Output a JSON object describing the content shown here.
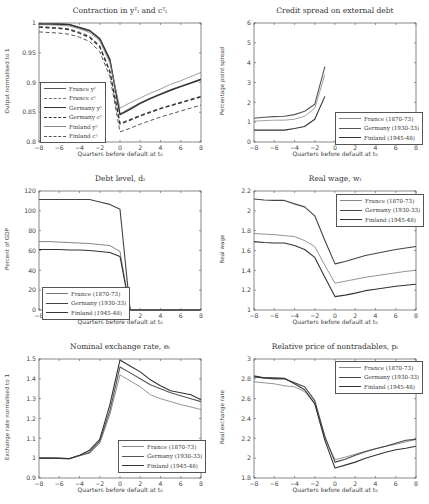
{
  "chart_data": [
    {
      "type": "line",
      "id": "contraction",
      "title": "Contraction in y_t^T and c_t^T",
      "xlabel": "Quarters before default at t_0",
      "ylabel": "Output normalised to 1",
      "xlim": [
        -8,
        8
      ],
      "ylim": [
        0.8,
        1.0
      ],
      "xticks": [
        -8,
        -6,
        -4,
        -2,
        0,
        2,
        4,
        6,
        8
      ],
      "yticks": [
        0.8,
        0.85,
        0.9,
        0.95,
        1
      ],
      "ytick_labels": [
        "0.8",
        "0.85",
        "0.9",
        "0.95",
        "1"
      ],
      "legend_position": "lower left",
      "legend_box": {
        "left": 40,
        "top": 82
      },
      "x": [
        -8,
        -7,
        -6,
        -5,
        -4,
        -3,
        -2,
        -1,
        0,
        1,
        2,
        3,
        4,
        5,
        6,
        7,
        8
      ],
      "series": [
        {
          "name": "France y^T",
          "style": "solid",
          "width": 0.8,
          "color": "#555555",
          "values": [
            0.999,
            0.999,
            0.999,
            0.998,
            0.993,
            0.988,
            0.975,
            0.94,
            0.847,
            0.857,
            0.866,
            0.874,
            0.881,
            0.888,
            0.894,
            0.9,
            0.906
          ]
        },
        {
          "name": "France c^T",
          "style": "dashed",
          "width": 0.8,
          "color": "#777777",
          "values": [
            0.994,
            0.993,
            0.992,
            0.99,
            0.985,
            0.978,
            0.962,
            0.92,
            0.832,
            0.838,
            0.845,
            0.851,
            0.857,
            0.862,
            0.867,
            0.872,
            0.877
          ]
        },
        {
          "name": "Germany y^T",
          "style": "solid",
          "width": 1.4,
          "color": "#333333",
          "values": [
            0.998,
            0.998,
            0.998,
            0.997,
            0.992,
            0.987,
            0.973,
            0.938,
            0.846,
            0.855,
            0.865,
            0.873,
            0.88,
            0.887,
            0.893,
            0.899,
            0.905
          ]
        },
        {
          "name": "Germany c^T",
          "style": "dashed",
          "width": 1.4,
          "color": "#333333",
          "values": [
            0.993,
            0.992,
            0.991,
            0.989,
            0.983,
            0.976,
            0.96,
            0.918,
            0.83,
            0.837,
            0.844,
            0.85,
            0.856,
            0.861,
            0.866,
            0.871,
            0.876
          ]
        },
        {
          "name": "Finland y^T",
          "style": "solid",
          "width": 0.8,
          "color": "#888888",
          "values": [
            0.997,
            0.997,
            0.996,
            0.995,
            0.99,
            0.984,
            0.97,
            0.933,
            0.857,
            0.866,
            0.874,
            0.882,
            0.889,
            0.897,
            0.903,
            0.91,
            0.917
          ]
        },
        {
          "name": "Finland c^T",
          "style": "dashed",
          "width": 1.0,
          "color": "#555555",
          "values": [
            0.985,
            0.984,
            0.983,
            0.981,
            0.976,
            0.969,
            0.952,
            0.91,
            0.817,
            0.823,
            0.83,
            0.836,
            0.842,
            0.847,
            0.852,
            0.857,
            0.862
          ]
        }
      ]
    },
    {
      "type": "line",
      "id": "credit-spread",
      "title": "Credit spread on external debt",
      "xlabel": "Quarters before default at t_0",
      "ylabel": "Percentage point spread",
      "xlim": [
        -8,
        8
      ],
      "ylim": [
        0,
        6
      ],
      "xticks": [
        -8,
        -6,
        -4,
        -2,
        0,
        2,
        4,
        6,
        8
      ],
      "yticks": [
        0,
        1,
        2,
        3,
        4,
        5,
        6
      ],
      "ytick_labels": [
        "0",
        "1",
        "2",
        "3",
        "4",
        "5",
        "6"
      ],
      "legend_position": "lower right",
      "legend_box": {
        "left": 335,
        "top": 112
      },
      "x": [
        -8,
        -7,
        -6,
        -5,
        -4,
        -3,
        -2,
        -1
      ],
      "series": [
        {
          "name": "France (1870-73)",
          "style": "solid",
          "width": 0.8,
          "color": "#888888",
          "values": [
            1.05,
            1.08,
            1.1,
            1.1,
            1.15,
            1.3,
            1.7,
            3.4
          ]
        },
        {
          "name": "Germany (1930-33)",
          "style": "solid",
          "width": 1.1,
          "color": "#555555",
          "values": [
            1.2,
            1.25,
            1.28,
            1.3,
            1.38,
            1.55,
            1.9,
            3.8
          ]
        },
        {
          "name": "Finland (1945-48)",
          "style": "solid",
          "width": 1.1,
          "color": "#333333",
          "values": [
            0.6,
            0.6,
            0.6,
            0.6,
            0.68,
            0.78,
            1.15,
            2.3
          ]
        }
      ]
    },
    {
      "type": "line",
      "id": "debt-level",
      "title": "Debt level, d_t",
      "xlabel": "Quarters before default at t_0",
      "ylabel": "Percent of GDP",
      "xlim": [
        -8,
        8
      ],
      "ylim": [
        0,
        120
      ],
      "xticks": [
        -8,
        -6,
        -4,
        -2,
        0,
        2,
        4,
        6,
        8
      ],
      "yticks": [
        0,
        20,
        40,
        60,
        80,
        100,
        120
      ],
      "ytick_labels": [
        "0",
        "20",
        "40",
        "60",
        "80",
        "100",
        "120"
      ],
      "legend_position": "lower left",
      "legend_box": {
        "left": 42,
        "top": 287
      },
      "x": [
        -8,
        -7,
        -6,
        -5,
        -4,
        -3,
        -2,
        -1,
        0,
        1,
        2,
        3,
        4,
        5,
        6,
        7,
        8
      ],
      "series": [
        {
          "name": "France (1870-73)",
          "style": "solid",
          "width": 0.9,
          "color": "#777777",
          "values": [
            69,
            69,
            68.5,
            68,
            67.5,
            67,
            66,
            65,
            59,
            0,
            0,
            0,
            0,
            0,
            0,
            0,
            0
          ]
        },
        {
          "name": "Germany (1930-33)",
          "style": "solid",
          "width": 1.1,
          "color": "#444444",
          "values": [
            111.5,
            111.5,
            111.5,
            111.5,
            111.5,
            111.5,
            109,
            106.5,
            101.5,
            0,
            0,
            0,
            0,
            0,
            0,
            0,
            0
          ]
        },
        {
          "name": "Finland (1945-48)",
          "style": "solid",
          "width": 1.1,
          "color": "#333333",
          "values": [
            61,
            61,
            61,
            60.5,
            60.5,
            60,
            59,
            58,
            54,
            0,
            0,
            0,
            0,
            0,
            0,
            0,
            0
          ]
        }
      ]
    },
    {
      "type": "line",
      "id": "real-wage",
      "title": "Real wage, w_t",
      "xlabel": "Quarters before default at t_0",
      "ylabel": "Real wage",
      "xlim": [
        -8,
        8
      ],
      "ylim": [
        1,
        2.2
      ],
      "xticks": [
        -8,
        -6,
        -4,
        -2,
        0,
        2,
        4,
        6,
        8
      ],
      "yticks": [
        1,
        1.2,
        1.4,
        1.6,
        1.8,
        2,
        2.2
      ],
      "ytick_labels": [
        "1",
        "1.2",
        "1.4",
        "1.6",
        "1.8",
        "2",
        "2.2"
      ],
      "legend_position": "upper right",
      "legend_box": {
        "left": 336,
        "top": 194
      },
      "x": [
        -8,
        -7,
        -6,
        -5,
        -4,
        -3,
        -2,
        -1,
        0,
        1,
        2,
        3,
        4,
        5,
        6,
        7,
        8
      ],
      "series": [
        {
          "name": "France (1870-73)",
          "style": "solid",
          "width": 0.9,
          "color": "#888888",
          "values": [
            1.77,
            1.765,
            1.76,
            1.75,
            1.74,
            1.7,
            1.64,
            1.45,
            1.27,
            1.29,
            1.31,
            1.33,
            1.345,
            1.36,
            1.375,
            1.39,
            1.4
          ]
        },
        {
          "name": "Germany (1930-33)",
          "style": "solid",
          "width": 1.1,
          "color": "#444444",
          "values": [
            2.12,
            2.11,
            2.105,
            2.105,
            2.07,
            2.04,
            1.95,
            1.7,
            1.465,
            1.49,
            1.52,
            1.55,
            1.57,
            1.59,
            1.61,
            1.625,
            1.64
          ]
        },
        {
          "name": "Finland (1945-48)",
          "style": "solid",
          "width": 1.1,
          "color": "#333333",
          "values": [
            1.69,
            1.68,
            1.675,
            1.675,
            1.65,
            1.61,
            1.53,
            1.33,
            1.135,
            1.15,
            1.17,
            1.195,
            1.21,
            1.225,
            1.24,
            1.25,
            1.26
          ]
        }
      ]
    },
    {
      "type": "line",
      "id": "nominal-exchange-rate",
      "title": "Nominal exchange rate, e_t",
      "xlabel": "Quarters before default at t_0",
      "ylabel": "Exchange rate normalised to 1",
      "xlim": [
        -8,
        8
      ],
      "ylim": [
        0.9,
        1.5
      ],
      "xticks": [
        -8,
        -6,
        -4,
        -2,
        0,
        2,
        4,
        6,
        8
      ],
      "yticks": [
        0.9,
        1,
        1.1,
        1.2,
        1.3,
        1.4,
        1.5
      ],
      "ytick_labels": [
        "0.9",
        "1",
        "1.1",
        "1.2",
        "1.3",
        "1.4",
        "1.5"
      ],
      "legend_position": "lower right",
      "legend_box": {
        "left": 118,
        "top": 440
      },
      "x": [
        -8,
        -7,
        -6,
        -5,
        -4,
        -3,
        -2,
        -1,
        0,
        1,
        2,
        3,
        4,
        5,
        6,
        7,
        8
      ],
      "series": [
        {
          "name": "France (1870-73)",
          "style": "solid",
          "width": 0.9,
          "color": "#888888",
          "values": [
            1.0,
            1.0,
            0.998,
            0.996,
            1.012,
            1.025,
            1.075,
            1.22,
            1.42,
            1.39,
            1.36,
            1.32,
            1.3,
            1.285,
            1.27,
            1.258,
            1.245
          ]
        },
        {
          "name": "Germany (1930-33)",
          "style": "solid",
          "width": 1.1,
          "color": "#555555",
          "values": [
            1.0,
            1.0,
            0.999,
            0.997,
            1.013,
            1.03,
            1.085,
            1.24,
            1.46,
            1.43,
            1.4,
            1.37,
            1.35,
            1.33,
            1.315,
            1.3,
            1.285
          ]
        },
        {
          "name": "Finland (1945-48)",
          "style": "solid",
          "width": 1.1,
          "color": "#333333",
          "values": [
            1.0,
            1.0,
            1.0,
            0.998,
            1.015,
            1.04,
            1.095,
            1.27,
            1.495,
            1.465,
            1.435,
            1.395,
            1.365,
            1.34,
            1.33,
            1.32,
            1.295
          ]
        }
      ]
    },
    {
      "type": "line",
      "id": "relative-price-nontradables",
      "title": "Relative price of nontradables, p_t",
      "xlabel": "Quarters before default at t_0",
      "ylabel": "Real exchange rate",
      "xlim": [
        -8,
        8
      ],
      "ylim": [
        1.8,
        3.0
      ],
      "xticks": [
        -8,
        -6,
        -4,
        -2,
        0,
        2,
        4,
        6,
        8
      ],
      "yticks": [
        1.8,
        2,
        2.2,
        2.4,
        2.6,
        2.8,
        3
      ],
      "ytick_labels": [
        "1.8",
        "2",
        "2.2",
        "2.4",
        "2.6",
        "2.8",
        "3"
      ],
      "legend_position": "upper right",
      "legend_box": {
        "left": 335,
        "top": 361
      },
      "x": [
        -8,
        -7,
        -6,
        -5,
        -4,
        -3,
        -2,
        -1,
        0,
        1,
        2,
        3,
        4,
        5,
        6,
        7,
        8
      ],
      "series": [
        {
          "name": "France (1870-73)",
          "style": "solid",
          "width": 0.9,
          "color": "#888888",
          "values": [
            2.77,
            2.76,
            2.75,
            2.73,
            2.72,
            2.67,
            2.55,
            2.2,
            1.985,
            2.01,
            2.04,
            2.07,
            2.095,
            2.12,
            2.14,
            2.165,
            2.19
          ]
        },
        {
          "name": "Germany (1930-33)",
          "style": "solid",
          "width": 1.1,
          "color": "#444444",
          "values": [
            2.83,
            2.81,
            2.8,
            2.8,
            2.76,
            2.72,
            2.58,
            2.22,
            1.96,
            1.99,
            2.03,
            2.065,
            2.095,
            2.12,
            2.15,
            2.18,
            2.19
          ]
        },
        {
          "name": "Finland (1945-48)",
          "style": "solid",
          "width": 1.1,
          "color": "#333333",
          "values": [
            2.82,
            2.81,
            2.81,
            2.805,
            2.75,
            2.69,
            2.55,
            2.18,
            1.9,
            1.93,
            1.96,
            2.0,
            2.03,
            2.06,
            2.085,
            2.1,
            2.12
          ]
        }
      ]
    }
  ],
  "panels": {
    "p0": {
      "title": "Contraction in yᵀₜ and cᵀₜ",
      "xlabel": "Quarters before default at t₀",
      "ylabel": "Output normalised to 1"
    },
    "p1": {
      "title": "Credit spread on external debt",
      "xlabel": "Quarters before default at t₀",
      "ylabel": "Percentage point spread"
    },
    "p2": {
      "title": "Debt level, dₜ",
      "xlabel": "Quarters before default at t₀",
      "ylabel": "Percent of GDP"
    },
    "p3": {
      "title": "Real wage, wₜ",
      "xlabel": "Quarters before default at t₀",
      "ylabel": "Real wage"
    },
    "p4": {
      "title": "Nominal exchange rate, eₜ",
      "xlabel": "Quarters before default at t₀",
      "ylabel": "Exchange rate normalised to 1"
    },
    "p5": {
      "title": "Relative price of nontradables, pₜ",
      "xlabel": "Quarters before default at t₀",
      "ylabel": "Real exchange rate"
    }
  },
  "legends": {
    "p0": [
      "France yᵀ",
      "France cᵀ",
      "Germany yᵀ",
      "Germany cᵀ",
      "Finland yᵀ",
      "Finland cᵀ"
    ],
    "p1": [
      "France (1870-73)",
      "Germany (1930-33)",
      "Finland (1945-48)"
    ],
    "p2": [
      "France (1870-73)",
      "Germany (1930-33)",
      "Finland (1945-48)"
    ],
    "p3": [
      "France (1870-73)",
      "Germany (1930-33)",
      "Finland (1945-48)"
    ],
    "p4": [
      "France (1870-73)",
      "Germany (1930-33)",
      "Finland (1945-48)"
    ],
    "p5": [
      "France (1870-73)",
      "Germany (1930-33)",
      "Finland (1945-48)"
    ]
  }
}
